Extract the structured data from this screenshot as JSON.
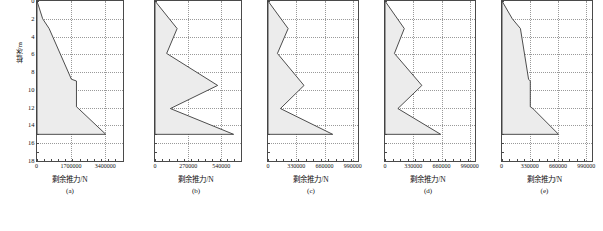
{
  "figure": {
    "ylabel": "桩深/m",
    "xlabel": "剩余推力/N",
    "y_ticks": [
      0,
      2,
      4,
      6,
      8,
      10,
      12,
      14,
      16,
      18
    ],
    "y_tick_labels": [
      "0",
      "2",
      "4",
      "6",
      "8",
      "10",
      "12",
      "14",
      "16",
      "18"
    ],
    "ylim": [
      0,
      18
    ],
    "y_minor_step": 1
  },
  "chart_data": [
    {
      "type": "area",
      "panel": "a",
      "caption": "(a)",
      "title": "",
      "xlabel": "剩余推力/N",
      "ylabel": "桩深/m",
      "xlim": [
        0,
        4250000
      ],
      "ylim": [
        0,
        18
      ],
      "x_ticks": [
        0,
        1700000,
        3400000
      ],
      "x_tick_labels": [
        "0",
        "1700000",
        "3400000"
      ],
      "show_y_tick_labels": true,
      "grid": true,
      "x": [
        0,
        280000,
        600000,
        1700000,
        1950000,
        1950000,
        2050000,
        3400000,
        0
      ],
      "y": [
        0,
        2.0,
        3.1,
        8.8,
        9.0,
        11.9,
        12.1,
        15.0,
        15.0
      ],
      "series_note": "residual thrust vs pile depth"
    },
    {
      "type": "area",
      "panel": "b",
      "caption": "(b)",
      "title": "",
      "xlabel": "剩余推力/N",
      "ylabel": "桩深/m",
      "xlim": [
        0,
        700000
      ],
      "ylim": [
        0,
        18
      ],
      "x_ticks": [
        0,
        270000,
        540000
      ],
      "x_tick_labels": [
        "0",
        "270000",
        "540000"
      ],
      "show_y_tick_labels": false,
      "grid": true,
      "x": [
        0,
        180000,
        95000,
        510000,
        125000,
        640000,
        0
      ],
      "y": [
        0,
        3.1,
        5.9,
        9.5,
        12.1,
        15.0,
        15.0
      ],
      "series_note": "residual thrust vs pile depth"
    },
    {
      "type": "area",
      "panel": "c",
      "caption": "(c)",
      "title": "",
      "xlabel": "剩余推力/N",
      "ylabel": "桩深/m",
      "xlim": [
        0,
        1050000
      ],
      "ylim": [
        0,
        18
      ],
      "x_ticks": [
        0,
        330000,
        660000,
        990000
      ],
      "x_tick_labels": [
        "0",
        "330000",
        "660000",
        "990000"
      ],
      "show_y_tick_labels": false,
      "grid": true,
      "x": [
        0,
        235000,
        110000,
        420000,
        145000,
        755000,
        0
      ],
      "y": [
        0,
        3.1,
        5.9,
        9.5,
        12.1,
        15.0,
        15.0
      ],
      "series_note": "residual thrust vs pile depth"
    },
    {
      "type": "area",
      "panel": "d",
      "caption": "(d)",
      "title": "",
      "xlabel": "剩余推力/N",
      "ylabel": "桩深/m",
      "xlim": [
        0,
        1050000
      ],
      "ylim": [
        0,
        18
      ],
      "x_ticks": [
        0,
        330000,
        660000,
        990000
      ],
      "x_tick_labels": [
        "0",
        "330000",
        "660000",
        "990000"
      ],
      "show_y_tick_labels": false,
      "grid": true,
      "x": [
        0,
        225000,
        110000,
        430000,
        150000,
        650000,
        0
      ],
      "y": [
        0,
        3.1,
        5.9,
        9.5,
        12.1,
        15.0,
        15.0
      ],
      "series_note": "residual thrust vs pile depth"
    },
    {
      "type": "area",
      "panel": "e",
      "caption": "(e)",
      "title": "",
      "xlabel": "剩余推力/N",
      "ylabel": "桩深/m",
      "xlim": [
        0,
        1050000
      ],
      "ylim": [
        0,
        18
      ],
      "x_ticks": [
        0,
        330000,
        660000,
        990000
      ],
      "x_tick_labels": [
        "0",
        "330000",
        "660000",
        "990000"
      ],
      "show_y_tick_labels": false,
      "grid": true,
      "x": [
        0,
        120000,
        215000,
        310000,
        330000,
        330000,
        360000,
        660000,
        0
      ],
      "y": [
        0,
        2.0,
        3.1,
        8.8,
        9.0,
        11.9,
        12.1,
        15.0,
        15.0
      ],
      "series_note": "residual thrust vs pile depth"
    }
  ]
}
